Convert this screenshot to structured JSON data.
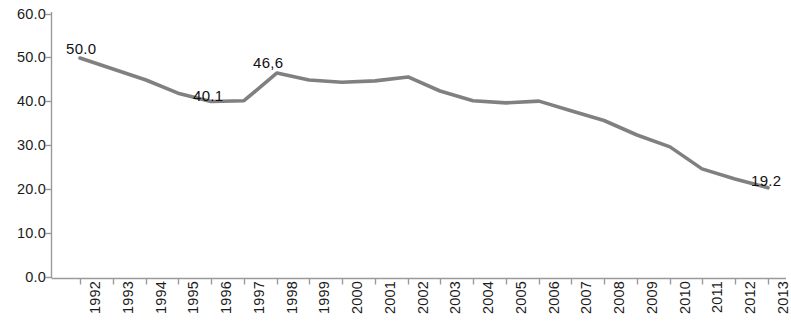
{
  "chart_data": {
    "type": "line",
    "title": "",
    "subtitle": "",
    "xlabel": "",
    "ylabel": "",
    "categories": [
      "1992",
      "1993",
      "1994",
      "1995",
      "1996",
      "1997",
      "1998",
      "1999",
      "2000",
      "2001",
      "2002",
      "2003",
      "2004",
      "2005",
      "2006",
      "2007",
      "2008",
      "2009",
      "2010",
      "2011",
      "2012",
      "2013"
    ],
    "values": [
      50.0,
      47.5,
      45.0,
      42.0,
      40.1,
      40.3,
      46.6,
      45.0,
      44.5,
      44.8,
      45.7,
      42.5,
      40.3,
      39.8,
      40.2,
      38.0,
      35.8,
      32.5,
      29.8,
      24.8,
      22.5,
      20.5
    ],
    "series": [
      {
        "name": "",
        "values": [
          50.0,
          47.5,
          45.0,
          42.0,
          40.1,
          40.3,
          46.6,
          45.0,
          44.5,
          44.8,
          45.7,
          42.5,
          40.3,
          39.8,
          40.2,
          38.0,
          35.8,
          32.5,
          29.8,
          24.8,
          22.5,
          20.5
        ]
      }
    ],
    "ylim": [
      0.0,
      60.0
    ],
    "ytick_step": 10.0,
    "ytick_labels": [
      "60.0",
      "50.0",
      "40.0",
      "30.0",
      "20.0",
      "10.0",
      "0.0"
    ],
    "ytick_values": [
      60.0,
      50.0,
      40.0,
      30.0,
      20.0,
      10.0,
      0.0
    ],
    "grid": false,
    "legend": false,
    "legend_position": "none",
    "line_color": "#808080",
    "line_width": 3.6,
    "markers": false,
    "annotations": [
      {
        "category": "1992",
        "value": 50.0,
        "text": "50.0",
        "x": 66,
        "y": 41
      },
      {
        "category": "1996",
        "value": 40.1,
        "text": "40.1",
        "x": 193,
        "y": 88
      },
      {
        "category": "1998",
        "value": 46.6,
        "text": "46,6",
        "x": 253,
        "y": 55
      },
      {
        "category": "2013",
        "value": 20.5,
        "text": "19.2",
        "x": 751,
        "y": 173
      }
    ]
  },
  "axis": {
    "x_tick_positions": [
      80,
      113,
      146,
      178,
      211,
      244,
      277,
      309,
      342,
      375,
      408,
      440,
      473,
      506,
      539,
      571,
      604,
      637,
      670,
      702,
      735,
      768
    ],
    "y_label_positions": [
      14,
      57,
      101,
      145,
      189,
      233,
      277
    ]
  }
}
